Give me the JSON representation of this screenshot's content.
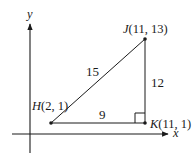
{
  "diagram": {
    "type": "right-triangle-coordinate-plane",
    "axes": {
      "x_label": "x",
      "y_label": "y"
    },
    "points": [
      {
        "name": "H",
        "coords": "(2, 1)",
        "label": "H(2, 1)"
      },
      {
        "name": "J",
        "coords": "(11, 13)",
        "label": "J(11, 13)"
      },
      {
        "name": "K",
        "coords": "(11, 1)",
        "label": "K(11, 1)"
      }
    ],
    "sides": [
      {
        "from": "H",
        "to": "J",
        "length": "15"
      },
      {
        "from": "J",
        "to": "K",
        "length": "12"
      },
      {
        "from": "H",
        "to": "K",
        "length": "9"
      }
    ],
    "right_angle_at": "K",
    "colors": {
      "stroke": "#1a1a1a",
      "background": "#ffffff"
    }
  },
  "labels": {
    "y_axis": "y",
    "x_axis": "x",
    "H_name": "H",
    "H_coords": "(2, 1)",
    "J_name": "J",
    "J_coords": "(11, 13)",
    "K_name": "K",
    "K_coords": "(11, 1)",
    "side_HJ": "15",
    "side_JK": "12",
    "side_HK": "9"
  }
}
